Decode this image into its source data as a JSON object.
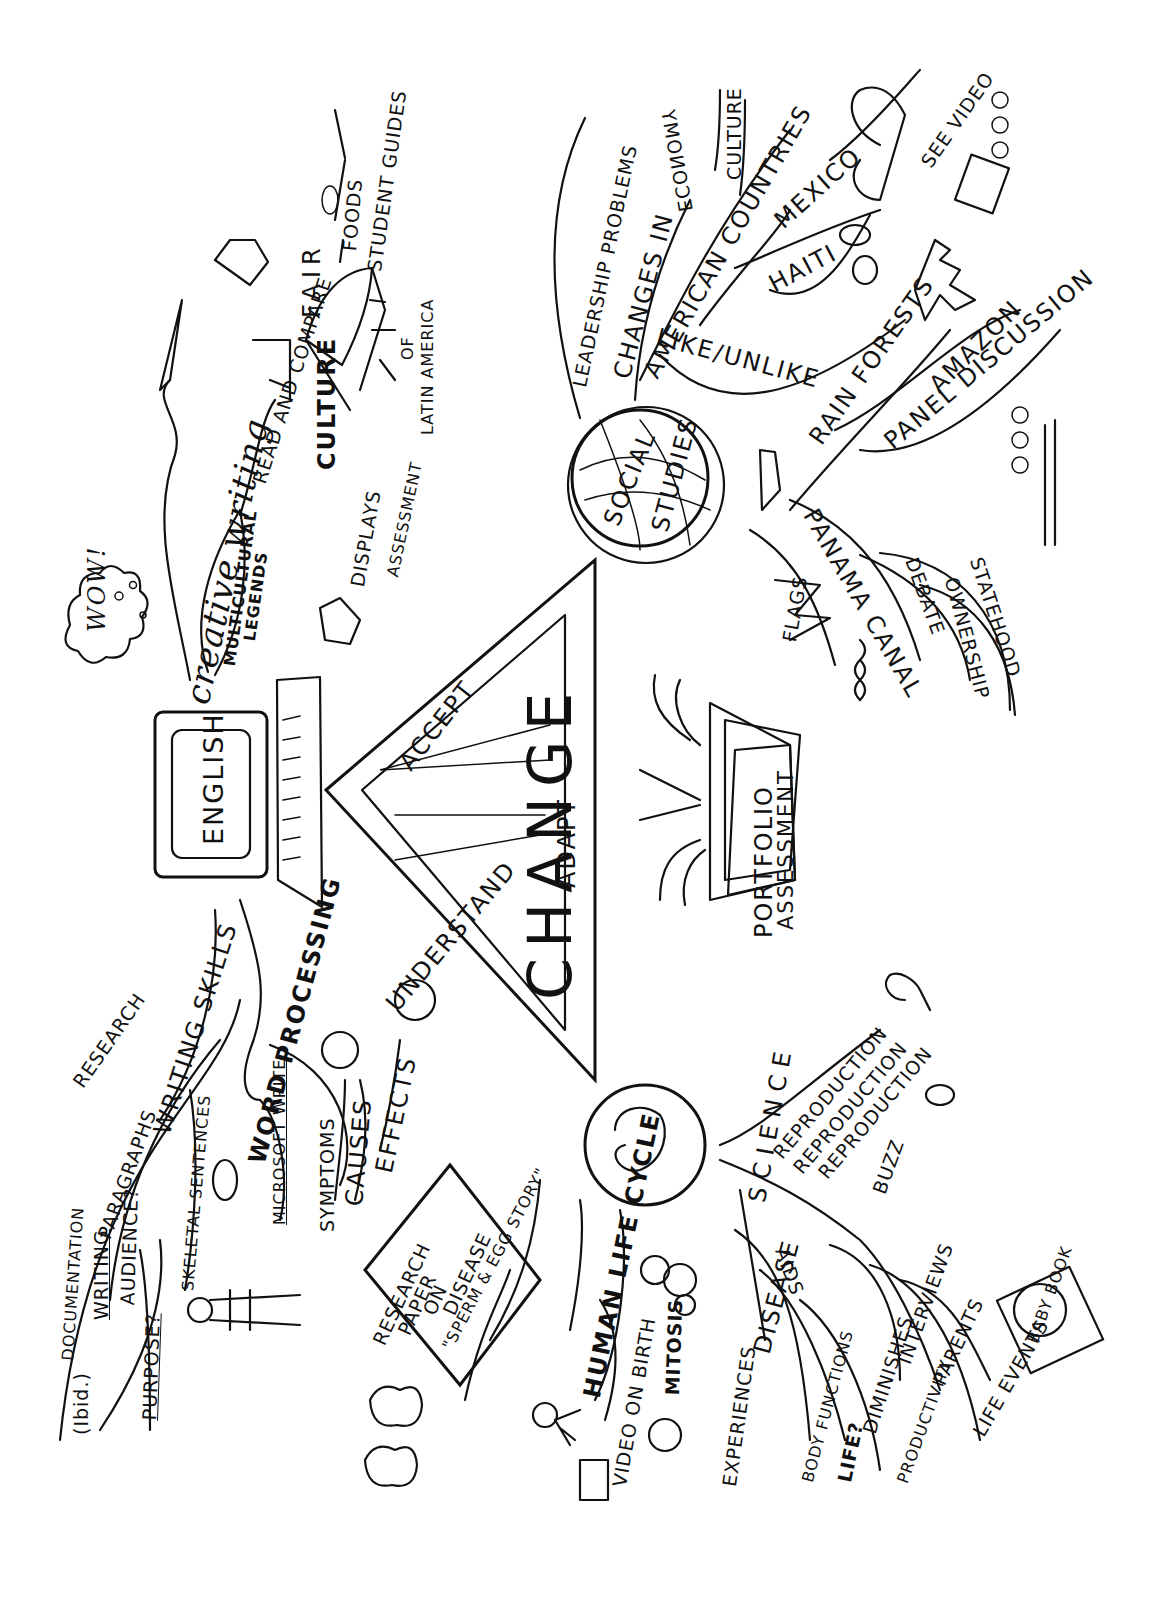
{
  "center": {
    "title": "CHANGE",
    "sides": {
      "left": "UNDERSTAND",
      "top": "ACCEPT",
      "right": "ADAPT"
    }
  },
  "portfolio": {
    "line1": "PORTFOLIO",
    "line2": "ASSESSMENT"
  },
  "english": {
    "hub": "ENGLISH",
    "creative_writing": "creative writing",
    "wow": "WOW!",
    "legends": {
      "line1": "MULTICULTURAL",
      "line2": "LEGENDS"
    },
    "read_compare": "READ AND COMPARE",
    "culture_fair": {
      "culture": "CULTURE",
      "fair": "FAIR",
      "of": "OF",
      "latin_america": "LATIN AMERICA"
    },
    "foods": "FOODS",
    "student_guides": "STUDENT GUIDES",
    "displays": "DISPLAYS",
    "assessment": "ASSESSMENT",
    "research": "RESEARCH",
    "documentation": "DOCUMENTATION",
    "ibid": "(Ibid.)",
    "paragraphs": "PARAGRAPHS",
    "writing": "WRITING",
    "audience": "AUDIENCE?",
    "purpose": "PURPOSE?",
    "writing_skills": "WRITING SKILLS",
    "skeletal_sentences": "SKELETAL SENTENCES",
    "word_processing": "WORD PROCESSING",
    "microsoft_write": "MICROSOFT WRITE"
  },
  "social_studies": {
    "hub_line1": "SOCIAL",
    "hub_line2": "STUDIES",
    "leadership": "LEADERSHIP PROBLEMS",
    "changes_in": "CHANGES IN",
    "american_countries": "AMERICAN COUNTRIES",
    "economy": "ECONOMY",
    "culture": "CULTURE",
    "mexico": "MEXICO",
    "see_video": "SEE VIDEO",
    "haiti": "HAITI",
    "like_unlike": "LIKE/UNLIKE",
    "rain_forests": "RAIN FORESTS",
    "amazon": "AMAZON",
    "panel_discussion": "PANEL DISCUSSION",
    "panama_canal": "PANAMA CANAL",
    "flags": "FLAGS",
    "debate": "DEBATE",
    "ownership": "OWNERSHIP",
    "statehood": "STATEHOOD"
  },
  "science": {
    "hub": "SCIENCE",
    "reproduction": [
      "REPRODUCTION",
      "REPRODUCTION",
      "REPRODUCTION"
    ],
    "buzz": "BUZZ",
    "research_paper": {
      "line1": "RESEARCH",
      "line2": "PAPER",
      "line3": "ON",
      "line4": "DISEASE"
    },
    "symptoms": "SYMPTOMS",
    "causes": "CAUSES",
    "effects": "EFFECTS",
    "sperm_egg": "\"SPERM & EGG STORY\"",
    "human_life_cycle": "HUMAN LIFE CYCLE",
    "video_birth": "VIDEO ON BIRTH",
    "mitosis": "MITOSIS",
    "experiences": "EXPERIENCES",
    "disease": "DISEASE",
    "aids": "AIDS",
    "hmm": "HMM",
    "body_functions": "BODY FUNCTIONS",
    "life": "LIFE?",
    "shes": "SHES",
    "diminishes": "DIMINISHES",
    "interviews": "INTERVIEWS",
    "productivity": "PRODUCTIVITY",
    "parents": "PARENTS",
    "life_events": "LIFE EVENTS",
    "baby_book": "BABY BOOK"
  }
}
